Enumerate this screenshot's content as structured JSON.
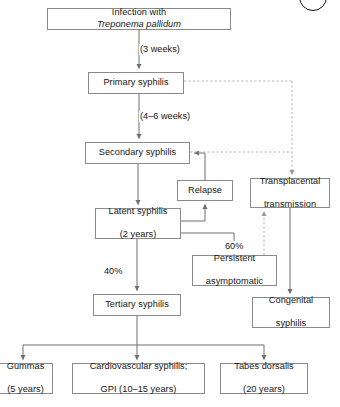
{
  "diagram": {
    "colors": {
      "box_border": "#8a8a8a",
      "line": "#6f6f6f",
      "dashed_line": "#b5b5b5",
      "text": "#161616",
      "background": "#ffffff"
    },
    "corner_mark": {
      "name": "figure-circle-marker",
      "shape": "circle"
    },
    "nodes": [
      {
        "id": "infection",
        "label_prefix": "Infection with ",
        "label_italic": "Treponema pallidum",
        "label_suffix": "",
        "x": 47,
        "y": 8,
        "w": 184,
        "h": 22
      },
      {
        "id": "primary",
        "label": "Primary syphilis",
        "x": 88,
        "y": 72,
        "w": 96,
        "h": 22
      },
      {
        "id": "secondary",
        "label": "Secondary syphilis",
        "x": 85,
        "y": 142,
        "w": 105,
        "h": 22
      },
      {
        "id": "relapse",
        "label": "Relapse",
        "x": 177,
        "y": 180,
        "w": 56,
        "h": 21
      },
      {
        "id": "transplacental",
        "line1": "Transplacental",
        "line2": "transmission",
        "x": 250,
        "y": 178,
        "w": 80,
        "h": 30
      },
      {
        "id": "latent",
        "line1": "Latent syphilis",
        "line2": "(2 years)",
        "x": 95,
        "y": 208,
        "w": 86,
        "h": 31
      },
      {
        "id": "persistent",
        "line1": "Persistent",
        "line2": "asymptomatic",
        "x": 192,
        "y": 255,
        "w": 85,
        "h": 31
      },
      {
        "id": "congenital",
        "line1": "Congenital",
        "line2": "syphilis",
        "x": 252,
        "y": 297,
        "w": 78,
        "h": 31
      },
      {
        "id": "tertiary",
        "label": "Tertiary syphilis",
        "x": 93,
        "y": 294,
        "w": 88,
        "h": 22
      },
      {
        "id": "gummas",
        "line1": "Gummas",
        "line2": "(5 years)",
        "x": -2,
        "y": 363,
        "w": 55,
        "h": 31
      },
      {
        "id": "cardiovascular",
        "line1": "Cardiovascular syphilis;",
        "line2": "GPI (10–15 years)",
        "x": 72,
        "y": 363,
        "w": 133,
        "h": 31
      },
      {
        "id": "tabes",
        "line1": "Tabes dorsalis",
        "line2": "(20 years)",
        "x": 220,
        "y": 363,
        "w": 88,
        "h": 31
      }
    ],
    "edge_labels": [
      {
        "id": "three-weeks",
        "text": "(3 weeks)",
        "x": 139,
        "y": 44
      },
      {
        "id": "four-six-weeks",
        "text": "(4–6 weeks)",
        "x": 139,
        "y": 111
      },
      {
        "id": "sixty-percent",
        "text": "60%",
        "x": 224,
        "y": 241
      },
      {
        "id": "forty-percent",
        "text": "40%",
        "x": 103,
        "y": 266
      }
    ],
    "edges": [
      {
        "id": "infection-to-primary",
        "style": "solid",
        "from": "infection",
        "to": "primary",
        "label": "(3 weeks)"
      },
      {
        "id": "primary-to-secondary",
        "style": "solid",
        "from": "primary",
        "to": "secondary",
        "label": "(4–6 weeks)"
      },
      {
        "id": "secondary-to-latent",
        "style": "solid",
        "from": "secondary",
        "to": "latent",
        "label": ""
      },
      {
        "id": "latent-to-relapse",
        "style": "solid",
        "from": "latent",
        "to": "relapse",
        "label": ""
      },
      {
        "id": "relapse-to-secondary",
        "style": "solid",
        "from": "relapse",
        "to": "secondary",
        "label": ""
      },
      {
        "id": "latent-to-persistent",
        "style": "solid",
        "from": "latent",
        "to": "persistent",
        "label": "60%"
      },
      {
        "id": "latent-to-tertiary",
        "style": "solid",
        "from": "latent",
        "to": "tertiary",
        "label": "40%"
      },
      {
        "id": "tertiary-to-gummas",
        "style": "solid",
        "from": "tertiary",
        "to": "gummas",
        "label": ""
      },
      {
        "id": "tertiary-to-cardiovascular",
        "style": "solid",
        "from": "tertiary",
        "to": "cardiovascular",
        "label": ""
      },
      {
        "id": "tertiary-to-tabes",
        "style": "solid",
        "from": "tertiary",
        "to": "tabes",
        "label": ""
      },
      {
        "id": "primary-to-transplacental",
        "style": "dashed",
        "from": "primary",
        "to": "transplacental",
        "label": ""
      },
      {
        "id": "secondary-to-transplacental",
        "style": "dashed",
        "from": "secondary",
        "to": "transplacental",
        "label": ""
      },
      {
        "id": "persistent-to-transplacental",
        "style": "dashed",
        "from": "persistent",
        "to": "transplacental",
        "label": ""
      },
      {
        "id": "transplacental-to-congenital",
        "style": "solid",
        "from": "transplacental",
        "to": "congenital",
        "label": ""
      }
    ]
  }
}
